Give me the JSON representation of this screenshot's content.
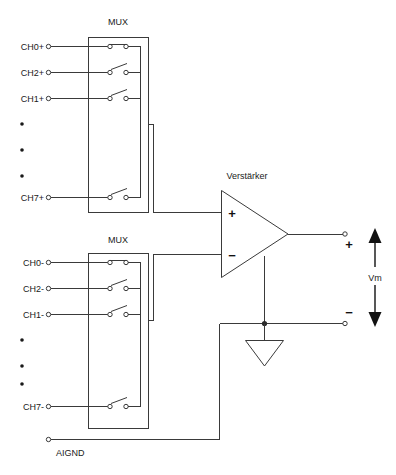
{
  "diagram": {
    "mux_top": {
      "label": "MUX",
      "channels": [
        {
          "label": "CH0+",
          "switch_state": "closed"
        },
        {
          "label": "CH2+",
          "switch_state": "open"
        },
        {
          "label": "CH1+",
          "switch_state": "open"
        },
        {
          "label": "CH7+",
          "switch_state": "open"
        }
      ],
      "ellipsis": "•"
    },
    "mux_bottom": {
      "label": "MUX",
      "channels": [
        {
          "label": "CH0-",
          "switch_state": "closed"
        },
        {
          "label": "CH2-",
          "switch_state": "open"
        },
        {
          "label": "CH1-",
          "switch_state": "open"
        },
        {
          "label": "CH7-",
          "switch_state": "open"
        }
      ],
      "ellipsis": "•"
    },
    "ground": {
      "label": "AIGND"
    },
    "amplifier": {
      "label": "Verstärker",
      "input_plus": "+",
      "input_minus": "−"
    },
    "output": {
      "plus": "+",
      "minus": "−",
      "measure_label": "Vm"
    },
    "colors": {
      "wire": "#3a3a3a",
      "text": "#1a1a1a",
      "background": "#ffffff",
      "marker": "#111111"
    }
  }
}
